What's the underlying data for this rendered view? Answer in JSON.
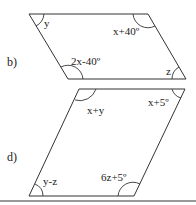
{
  "figures": [
    {
      "part_label": "b)",
      "shape": "parallelogram",
      "angles": {
        "top_left": "y",
        "top_right": "x+40º",
        "bottom_left": "2x-40º",
        "bottom_right": "z"
      }
    },
    {
      "part_label": "d)",
      "shape": "parallelogram",
      "angles": {
        "top_left": "x+y",
        "top_right": "x+5º",
        "bottom_left": "y-z",
        "bottom_right": "6z+5º"
      }
    }
  ],
  "colors": {
    "line": "#333333",
    "rule": "#777777",
    "background": "#ffffff"
  }
}
